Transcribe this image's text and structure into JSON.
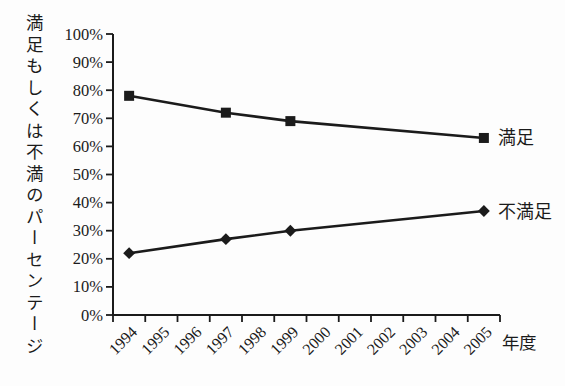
{
  "chart_data": {
    "type": "line",
    "title": "",
    "ylabel": "満足もしくは不満のパーセンテージ",
    "xlabel": "年度",
    "categories": [
      "1994",
      "1995",
      "1996",
      "1997",
      "1998",
      "1999",
      "2000",
      "2001",
      "2002",
      "2003",
      "2004",
      "2005"
    ],
    "y_tick_labels": [
      "0%",
      "10%",
      "20%",
      "30%",
      "40%",
      "50%",
      "60%",
      "70%",
      "80%",
      "90%",
      "100%"
    ],
    "ylim": [
      0,
      100
    ],
    "grid": false,
    "legend_position": "line-end-labels",
    "ink_color": "#1b1b1b",
    "background_color": "#fdfdfd",
    "series": [
      {
        "name": "満足",
        "marker": "square",
        "color": "#1b1b1b",
        "points": [
          {
            "x": "1994",
            "y": 78
          },
          {
            "x": "1997",
            "y": 72
          },
          {
            "x": "1999",
            "y": 69
          },
          {
            "x": "2005",
            "y": 63
          }
        ]
      },
      {
        "name": "不満足",
        "marker": "diamond",
        "color": "#1b1b1b",
        "points": [
          {
            "x": "1994",
            "y": 22
          },
          {
            "x": "1997",
            "y": 27
          },
          {
            "x": "1999",
            "y": 30
          },
          {
            "x": "2005",
            "y": 37
          }
        ]
      }
    ]
  }
}
